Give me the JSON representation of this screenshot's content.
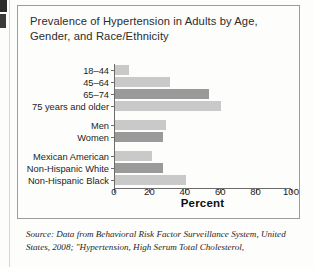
{
  "figure": {
    "title": "Prevalence of Hypertension in Adults by Age, Gender, and Race/Ethnicity",
    "source": "Source: Data from Behavioral Risk Factor Surveillance System, United States, 2008; \"Hypertension, High Serum Total Cholesterol,"
  },
  "colors": {
    "bar_light": "#c9c9c9",
    "bar_dark": "#9a9a9a",
    "axis": "#6e6c6a",
    "box_border": "#9e9c98",
    "text": "#1d1d1d"
  },
  "chart_data": {
    "type": "bar",
    "orientation": "horizontal",
    "title": "Prevalence of Hypertension in Adults by Age, Gender, and Race/Ethnicity",
    "xlabel": "Percent",
    "ylabel": "",
    "xlim": [
      0,
      100
    ],
    "xticks": [
      0,
      20,
      40,
      60,
      80,
      100
    ],
    "grid": false,
    "legend": "none",
    "categories": [
      "18–44",
      "45–64",
      "65–74",
      "75 years and older",
      "Men",
      "Women",
      "Mexican American",
      "Non-Hispanic White",
      "Non-Hispanic Black"
    ],
    "values": [
      8,
      31,
      53,
      60,
      29,
      27,
      21,
      27,
      40
    ],
    "bar_colors": [
      "#c9c9c9",
      "#c9c9c9",
      "#9a9a9a",
      "#c9c9c9",
      "#c9c9c9",
      "#9a9a9a",
      "#c9c9c9",
      "#9a9a9a",
      "#c9c9c9"
    ],
    "groups": [
      {
        "name": "Age",
        "categories": [
          "18–44",
          "45–64",
          "65–74",
          "75 years and older"
        ]
      },
      {
        "name": "Gender",
        "categories": [
          "Men",
          "Women"
        ]
      },
      {
        "name": "Race/Ethnicity",
        "categories": [
          "Mexican American",
          "Non-Hispanic White",
          "Non-Hispanic Black"
        ]
      }
    ]
  }
}
